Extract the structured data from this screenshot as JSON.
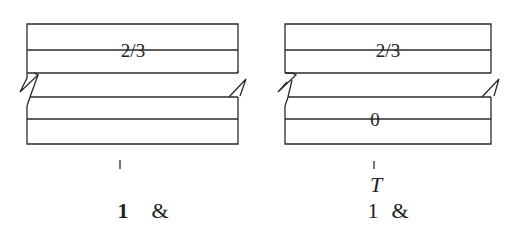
{
  "diagrams": [
    {
      "id": "left",
      "cells": [
        "2/3",
        "",
        "",
        ""
      ],
      "top_cell_label": "2/3",
      "lower_cell_label": "",
      "marker": "",
      "caption_number": "1",
      "caption_symbol": "&"
    },
    {
      "id": "right",
      "cells": [
        "2/3",
        "",
        "0",
        ""
      ],
      "top_cell_label": "2/3",
      "lower_cell_label": "0",
      "marker": "T",
      "caption_number": "1",
      "caption_symbol": "&"
    }
  ],
  "colors": {
    "line": "#2a2a2a",
    "background": "#ffffff"
  }
}
